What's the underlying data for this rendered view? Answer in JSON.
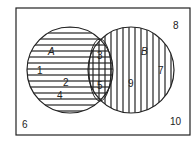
{
  "diagram": {
    "type": "venn",
    "universe_label_positions": "rectangle",
    "sets": [
      {
        "name": "A",
        "shading": "horizontal"
      },
      {
        "name": "B",
        "shading": "vertical"
      }
    ],
    "set_labels": {
      "A": "A",
      "B": "B"
    },
    "regions": {
      "A_only": [
        "1",
        "2",
        "4"
      ],
      "A_and_B": [
        "3",
        "5"
      ],
      "B_only": [
        "9",
        "7"
      ],
      "outside": [
        "8",
        "6",
        "10"
      ]
    },
    "numbers": {
      "n1": "1",
      "n2": "2",
      "n3": "3",
      "n4": "4",
      "n5": "5",
      "n6": "6",
      "n7": "7",
      "n8": "8",
      "n9": "9",
      "n10": "10"
    },
    "colors": {
      "stroke": "#222222",
      "background": "#ffffff"
    }
  }
}
